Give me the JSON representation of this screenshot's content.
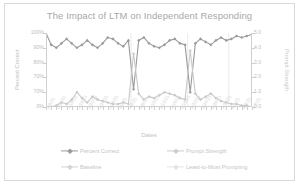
{
  "chart_title": "The Impact of LTM on Independent Responding",
  "axes": {
    "left_title": "Percent Correct",
    "right_title": "Prompt Strength",
    "x_title": "Dates"
  },
  "legend": {
    "percent_correct": "Percent Correct",
    "prompt_strength": "Prompt Strength",
    "baseline": "Baseline",
    "ltm": "Least-to-Most Prompting"
  },
  "colors": {
    "percent_correct": "#9a9a9a",
    "prompt_strength": "#c9c9c9",
    "baseline": "#bfbfbf",
    "ltm": "#dcdcdc",
    "axis": "#cfcfcf",
    "text": "#bdbdbd",
    "title": "#a8a8a8",
    "border": "#d9d9d9",
    "background": "#ffffff"
  },
  "chart_data": {
    "type": "line",
    "title": "The Impact of LTM on Independent Responding",
    "xlabel": "Dates",
    "ylabel": "Percent Correct",
    "y2label": "Prompt Strength",
    "grid": false,
    "legend_position": "bottom",
    "ylim": [
      0,
      100
    ],
    "y2lim": [
      0,
      5
    ],
    "yticks": [
      "100%",
      "90%",
      "80%",
      "70%",
      "70%",
      "0%"
    ],
    "ytick_values": [
      100,
      90,
      80,
      70,
      60,
      0
    ],
    "y2ticks": [
      "5.0",
      "4.0",
      "3.0",
      "2.0",
      "1.0",
      "0.0"
    ],
    "y2tick_values": [
      5,
      4,
      3,
      2,
      1,
      0
    ],
    "categories": [
      "2/9/21",
      "2/10/21",
      "2/11/21",
      "2/12/21",
      "2/16/21",
      "2/17/21",
      "2/18/21",
      "2/19/21",
      "2/22/21",
      "2/23/21",
      "2/24/21",
      "2/25/21",
      "2/26/21",
      "3/1/21",
      "3/2/21",
      "3/3/21",
      "3/4/21",
      "3/5/21",
      "3/8/21",
      "3/9/21",
      "3/10/21",
      "3/11/21",
      "3/12/21",
      "3/15/21",
      "3/16/21",
      "3/17/21",
      "3/18/21",
      "3/19/21",
      "3/22/21",
      "3/23/21",
      "3/24/21",
      "3/25/21",
      "3/26/21",
      "3/29/21",
      "3/30/21",
      "3/31/21",
      "4/1/21",
      "4/2/21",
      "4/5/21",
      "4/6/21",
      "4/7/21"
    ],
    "xtick_labels": [
      "2/9/21",
      "2/11/21",
      "2/16/21",
      "2/18/21",
      "2/22/21",
      "2/24/21",
      "2/26/21",
      "3/2/21",
      "3/4/21",
      "3/8/21",
      "3/10/21",
      "3/12/21",
      "3/16/21",
      "3/18/21",
      "3/22/21",
      "3/24/21",
      "3/26/21",
      "3/30/21",
      "4/1/21",
      "4/5/21",
      "4/7/21"
    ],
    "series": [
      {
        "name": "Percent Correct",
        "axis": "left",
        "color": "#9a9a9a",
        "values": [
          100,
          92,
          90,
          93,
          96,
          93,
          90,
          92,
          95,
          92,
          90,
          93,
          97,
          96,
          93,
          91,
          95,
          62,
          95,
          97,
          93,
          91,
          90,
          92,
          95,
          96,
          93,
          92,
          60,
          93,
          96,
          94,
          92,
          95,
          97,
          95,
          96,
          98,
          97,
          98,
          99
        ]
      },
      {
        "name": "Prompt Strength",
        "axis": "right",
        "color": "#c9c9c9",
        "values": [
          0.0,
          0.0,
          0.1,
          0.3,
          0.2,
          0.5,
          1.0,
          0.6,
          0.3,
          0.7,
          0.5,
          0.4,
          0.3,
          0.2,
          0.2,
          0.3,
          0.2,
          3.6,
          0.9,
          0.5,
          0.7,
          0.6,
          0.8,
          1.0,
          0.9,
          0.8,
          0.6,
          0.5,
          3.8,
          0.9,
          0.5,
          0.7,
          0.9,
          0.6,
          0.4,
          0.3,
          0.2,
          0.2,
          0.1,
          0.1,
          0.0
        ]
      }
    ],
    "phase_lines": [
      {
        "after_index": 16,
        "label": "Least-to-Most Prompting"
      },
      {
        "after_index": 27,
        "label": "Baseline"
      },
      {
        "after_index": 35,
        "label": "Least-to-Most Prompting"
      }
    ]
  }
}
